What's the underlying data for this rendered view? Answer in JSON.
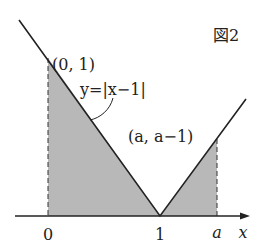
{
  "figure": {
    "title": "図2",
    "curve_label": "y=|x−1|",
    "point_top_left": "(0, 1)",
    "point_right": "(a, a−1)",
    "ticks": {
      "zero": "0",
      "one": "1",
      "a": "a"
    },
    "axis_label": "x",
    "colors": {
      "line": "#222222",
      "fill": "#b8b8b8",
      "background": "#ffffff"
    }
  }
}
